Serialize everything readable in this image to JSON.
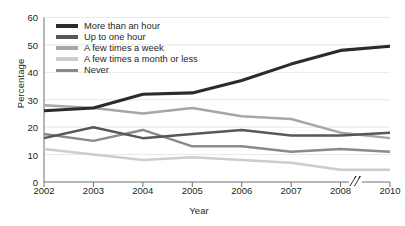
{
  "chart_data": {
    "type": "line",
    "title": "",
    "xlabel": "Year",
    "ylabel": "Percentage",
    "categories": [
      "2002",
      "2003",
      "2004",
      "2005",
      "2006",
      "2007",
      "2008",
      "2010"
    ],
    "x_axis_break": {
      "present": true,
      "symbol": "//",
      "between": [
        "2008",
        "2010"
      ]
    },
    "ylim": [
      0,
      60
    ],
    "yticks": [
      0,
      10,
      20,
      30,
      40,
      50,
      60
    ],
    "grid": "horizontal",
    "legend_position": "top-left",
    "series": [
      {
        "name": "More than an hour",
        "color": "#2b2b2b",
        "values": [
          26,
          27,
          32,
          32.5,
          37,
          43,
          48,
          49.5
        ]
      },
      {
        "name": "Up to one hour",
        "color": "#58585a",
        "values": [
          16,
          20,
          16,
          17.5,
          19,
          17,
          17,
          18
        ]
      },
      {
        "name": "A few times a week",
        "color": "#a6a6a6",
        "values": [
          28,
          27,
          25,
          27,
          24,
          23,
          18,
          16
        ]
      },
      {
        "name": "A few times a month or less",
        "color": "#cdcdcd",
        "values": [
          12,
          10,
          8,
          9,
          8,
          7,
          4.5,
          4.5
        ]
      },
      {
        "name": "Never",
        "color": "#8a8a8c",
        "values": [
          17.5,
          15,
          19,
          13,
          13,
          11,
          12,
          11
        ]
      }
    ]
  }
}
